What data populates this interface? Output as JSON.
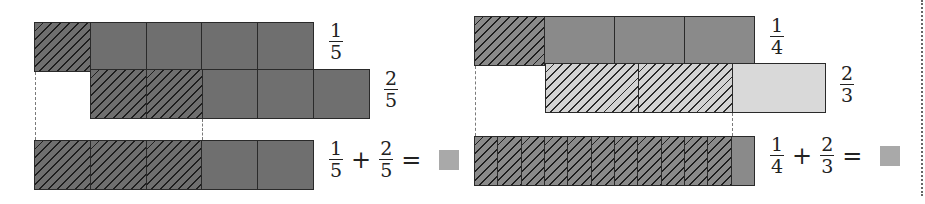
{
  "left_panel": {
    "row1": {
      "label": {
        "num": "1",
        "den": "5"
      },
      "cells": 5,
      "hatched": [
        0
      ]
    },
    "row2": {
      "label": {
        "num": "2",
        "den": "5"
      },
      "cells": 5,
      "hatched": [
        0,
        1
      ]
    },
    "row3": {
      "cells": 5,
      "hatched": [
        0,
        1,
        2
      ]
    },
    "equation": {
      "a_num": "1",
      "a_den": "5",
      "plus": "+",
      "b_num": "2",
      "b_den": "5",
      "equals": "="
    },
    "answer_placeholder": "blank-answer-box"
  },
  "right_panel": {
    "row1": {
      "label": {
        "num": "1",
        "den": "4"
      },
      "cells": 4,
      "hatched": [
        0
      ]
    },
    "row2": {
      "label": {
        "num": "2",
        "den": "3"
      },
      "cells": 3,
      "hatched": [
        0,
        1
      ]
    },
    "row3": {
      "cells": 12,
      "hatched": [
        0,
        1,
        2,
        3,
        4,
        5,
        6,
        7,
        8,
        9,
        10
      ]
    },
    "equation": {
      "a_num": "1",
      "a_den": "4",
      "plus": "+",
      "b_num": "2",
      "b_den": "3",
      "equals": "="
    },
    "answer_placeholder": "blank-answer-box"
  },
  "colors": {
    "dark_fill": "#6f6f6f",
    "light_fill": "#d9d9d9",
    "answer_box": "#a9a9a9",
    "outline": "#2a2a2a"
  }
}
